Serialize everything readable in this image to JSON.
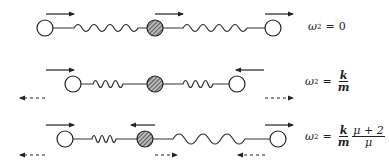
{
  "diagram": {
    "colors": {
      "ink": "#222222",
      "hatch_fill": "#888888",
      "background": "#ffffff"
    },
    "rows": [
      {
        "id": "mode-1",
        "equation": {
          "lhs": "ω",
          "power": "2",
          "eq": "=",
          "rhs": "0"
        },
        "masses": [
          {
            "type": "open",
            "cx": 45,
            "cy": 28,
            "arrow": "right"
          },
          {
            "type": "hatched",
            "cx": 155,
            "cy": 28,
            "arrow": "right"
          },
          {
            "type": "open",
            "cx": 273,
            "cy": 28,
            "arrow": "right"
          }
        ]
      },
      {
        "id": "mode-2",
        "equation": {
          "lhs": "ω",
          "power": "2",
          "eq": "=",
          "num": "k",
          "den": "m"
        },
        "masses": [
          {
            "type": "open",
            "cx": 73,
            "cy": 84,
            "arrow": "right"
          },
          {
            "type": "hatched",
            "cx": 155,
            "cy": 84,
            "arrow": "none"
          },
          {
            "type": "open",
            "cx": 237,
            "cy": 84,
            "arrow": "left"
          }
        ],
        "dashed_arrows": [
          "left",
          "right"
        ]
      },
      {
        "id": "mode-3",
        "equation": {
          "lhs": "ω",
          "power": "2",
          "eq": "=",
          "num1": "k",
          "den1": "m",
          "num2": "μ + 2",
          "den2": "μ"
        },
        "masses": [
          {
            "type": "open",
            "cx": 65,
            "cy": 139,
            "arrow": "right"
          },
          {
            "type": "hatched",
            "cx": 145,
            "cy": 139,
            "arrow": "left"
          },
          {
            "type": "open",
            "cx": 278,
            "cy": 139,
            "arrow": "right"
          }
        ],
        "dashed_arrows": [
          "left",
          "right",
          "left"
        ]
      }
    ]
  }
}
